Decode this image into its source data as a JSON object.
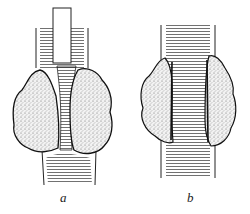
{
  "figure": {
    "panels": [
      {
        "id": "a",
        "label": "a",
        "description": "vessel with tube inserted, compressed by two tumor masses"
      },
      {
        "id": "b",
        "label": "b",
        "description": "vessel with tumor masses infiltrating the wall"
      }
    ],
    "colors": {
      "line": "#1a1a1a",
      "stipple": "#bdbdbd",
      "background": "#ffffff"
    }
  }
}
